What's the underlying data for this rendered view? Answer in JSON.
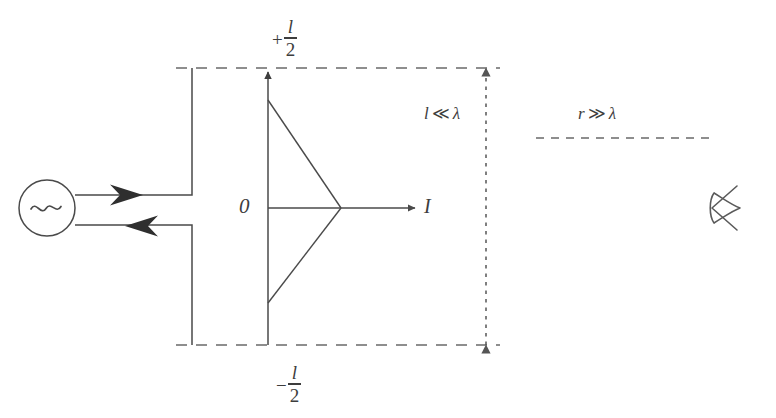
{
  "figure": {
    "background_color": "#ffffff",
    "stroke_color": "#4a4a4a",
    "ink_color": "#3d3d3d"
  },
  "labels": {
    "top_half_length": {
      "sign": "+",
      "numerator": "l",
      "denominator": "2",
      "text": "+l/2"
    },
    "bottom_half_length": {
      "sign": "−",
      "numerator": "l",
      "denominator": "2",
      "text": "−l/2"
    },
    "origin": "0",
    "current_axis": "I",
    "length_condition": {
      "lhs": "l",
      "operator": "≪",
      "rhs": "λ",
      "text": "l ≪ λ"
    },
    "distance_condition": {
      "lhs": "r",
      "operator": "≫",
      "rhs": "λ",
      "text": "r ≫ λ"
    }
  },
  "elements": {
    "source": {
      "name": "ac-source",
      "symbol": "~",
      "shape": "circle"
    },
    "feedline": {
      "name": "transmission-line",
      "arrow_top_direction": "right",
      "arrow_bottom_direction": "left"
    },
    "antenna": {
      "name": "dipole-antenna",
      "orientation": "vertical",
      "has_feed_gap": true
    },
    "current_profile": {
      "name": "triangular-current-distribution",
      "shape": "triangle",
      "apex_side": "right"
    },
    "observer": {
      "name": "observer-eye",
      "symbol": "eye"
    },
    "dimension_arrow": {
      "name": "length-dimension-arrow",
      "style": "dashed",
      "heads": "both"
    },
    "far_field_line": {
      "name": "far-field-distance-line",
      "style": "dashed"
    }
  }
}
